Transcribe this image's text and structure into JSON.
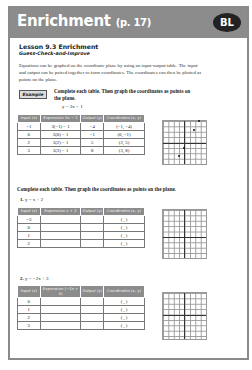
{
  "header": {
    "title": "Enrichment",
    "page_ref": "(p. 17)",
    "badge": "BL"
  },
  "lesson": {
    "title": "Lesson 9.3 Enrichment",
    "subtitle": "Guess-Check-and-Improve",
    "intro": "Equations can be graphed on the coordinate plane by using an input-output table. The input and output can be paired together to form coordinates. The coordinates can then be plotted as points on the plane."
  },
  "example": {
    "tag": "Example",
    "instruction": "Complete each table. Then graph the coordinates as points on the plane.",
    "equation": "y = 3x − 1",
    "headers": [
      "Input (x)",
      "Expression 3x − 1",
      "Output (y)",
      "Coordinates (x, y)"
    ],
    "rows": [
      [
        "−1",
        "3(−1) − 1",
        "−4",
        "(−1, −4)"
      ],
      [
        "0",
        "3(0) − 1",
        "−1",
        "(0, −1)"
      ],
      [
        "2",
        "3(2) − 1",
        "5",
        "(2, 5)"
      ],
      [
        "3",
        "3(3) − 1",
        "8",
        "(3, 8)"
      ]
    ]
  },
  "exercises": {
    "instruction": "Complete each table. Then graph the coordinates as points on the plane.",
    "problems": [
      {
        "number": "1.",
        "equation": "y = x + 2",
        "headers": [
          "Input (x)",
          "Expression x + 2",
          "Output (y)",
          "Coordinates (x, y)"
        ],
        "rows": [
          [
            "−3",
            "",
            "",
            "( , )"
          ],
          [
            "0",
            "",
            "",
            "( , )"
          ],
          [
            "1",
            "",
            "",
            "( , )"
          ],
          [
            "2",
            "",
            "",
            "( , )"
          ]
        ]
      },
      {
        "number": "2.",
        "equation": "y = −2x + 3",
        "headers": [
          "Input (x)",
          "Expression (−2x + 3)",
          "Output (y)",
          "Coordinates (x, y)"
        ],
        "rows": [
          [
            "0",
            "",
            "",
            "( , )"
          ],
          [
            "1",
            "",
            "",
            "( , )"
          ],
          [
            "2",
            "",
            "",
            "( , )"
          ],
          [
            "3",
            "",
            "",
            "( , )"
          ]
        ]
      }
    ]
  }
}
